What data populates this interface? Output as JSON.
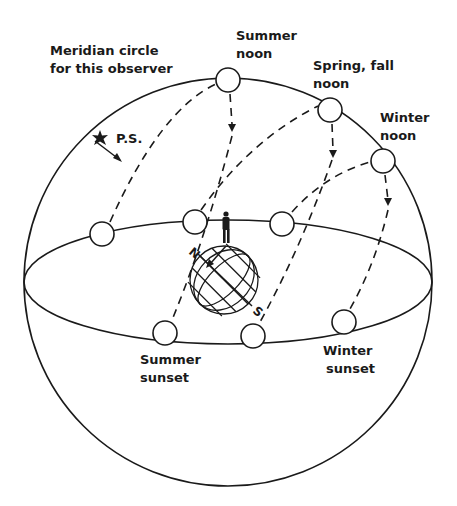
{
  "diagram": {
    "labels": {
      "meridian_line1": "Meridian circle",
      "meridian_line2": "for this observer",
      "polaris": "P.S.",
      "summer_noon_line1": "Summer",
      "summer_noon_line2": "noon",
      "spring_fall_noon_line1": "Spring, fall",
      "spring_fall_noon_line2": "noon",
      "winter_noon_line1": "Winter",
      "winter_noon_line2": "noon",
      "summer_sunset_line1": "Summer",
      "summer_sunset_line2": "sunset",
      "winter_sunset_line1": "Winter",
      "winter_sunset_line2": "sunset",
      "north": "N",
      "south": "S"
    },
    "colors": {
      "ink": "#1a1a1a",
      "background": "#ffffff"
    },
    "suns": [
      {
        "id": "summer-noon",
        "x": 228,
        "y": 80
      },
      {
        "id": "spring-fall-noon",
        "x": 330,
        "y": 110
      },
      {
        "id": "winter-noon",
        "x": 383,
        "y": 161
      },
      {
        "id": "summer-sunrise",
        "x": 102,
        "y": 234
      },
      {
        "id": "spring-fall-sunrise",
        "x": 195,
        "y": 222
      },
      {
        "id": "winter-sunrise",
        "x": 282,
        "y": 224
      },
      {
        "id": "summer-sunset",
        "x": 165,
        "y": 333
      },
      {
        "id": "spring-fall-sunset",
        "x": 253,
        "y": 336
      },
      {
        "id": "winter-sunset",
        "x": 344,
        "y": 322
      }
    ]
  }
}
